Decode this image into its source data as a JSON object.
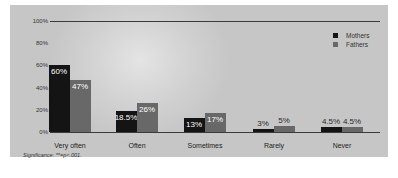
{
  "chart_data": {
    "type": "bar",
    "title": "",
    "xlabel": "",
    "ylabel": "",
    "ylim": [
      0,
      100
    ],
    "y_ticks": [
      "0%",
      "20%",
      "40%",
      "60%",
      "80%",
      "100%"
    ],
    "categories": [
      "Very often",
      "Often",
      "Sometimes",
      "Rarely",
      "Never"
    ],
    "series": [
      {
        "name": "Mothers",
        "color": "#141414",
        "values": [
          60,
          18.5,
          13,
          3,
          4.5
        ],
        "labels": [
          "60%",
          "18.5%",
          "13%",
          "3%",
          "4.5%"
        ]
      },
      {
        "name": "Fathers",
        "color": "#686868",
        "values": [
          47,
          26,
          17,
          5,
          4.5
        ],
        "labels": [
          "47%",
          "26%",
          "17%",
          "5%",
          "4.5%"
        ]
      }
    ],
    "legend_position": "top-right",
    "grid": false,
    "footnote": "Significance: **=p<.001."
  },
  "legend": {
    "mothers": "Mothers",
    "fathers": "Fathers"
  },
  "footnote": "Significance: **=p<.001."
}
